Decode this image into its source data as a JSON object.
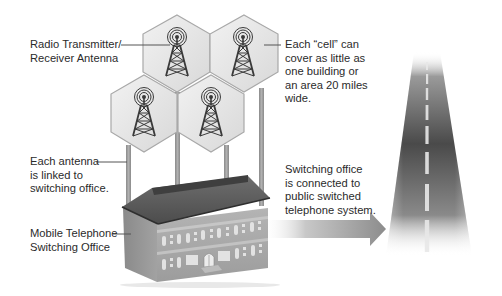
{
  "diagram": {
    "labels": {
      "antenna": {
        "lines": [
          "Radio Transmitter/",
          "Receiver Antenna"
        ]
      },
      "cell": {
        "lines": [
          "Each “cell” can",
          "cover as little as",
          "one building or",
          "an area 20 miles",
          "wide."
        ]
      },
      "linked": {
        "lines": [
          "Each antenna",
          "is linked to",
          "switching office."
        ]
      },
      "office": {
        "lines": [
          "Mobile Telephone",
          "Switching Office"
        ]
      },
      "pstn": {
        "lines": [
          "Switching office",
          "is connected to",
          "public switched",
          "telephone system."
        ]
      }
    },
    "elements": {
      "cells": [
        "cell-top-left",
        "cell-top-right",
        "cell-bottom-left",
        "cell-bottom-right"
      ],
      "icons": [
        "antenna-tower-icon",
        "building-icon",
        "arrow-icon",
        "highway-icon"
      ]
    },
    "colors": {
      "hex_fill": "#e6e6e6",
      "hex_stroke": "#a8a8a8",
      "tower": "#3a3a3a",
      "pole": "#9a9a9a",
      "roof": "#5a5a5a",
      "facade": "#a9a9a9",
      "road": "#4a4a4a",
      "text": "#2b2b2b"
    }
  }
}
